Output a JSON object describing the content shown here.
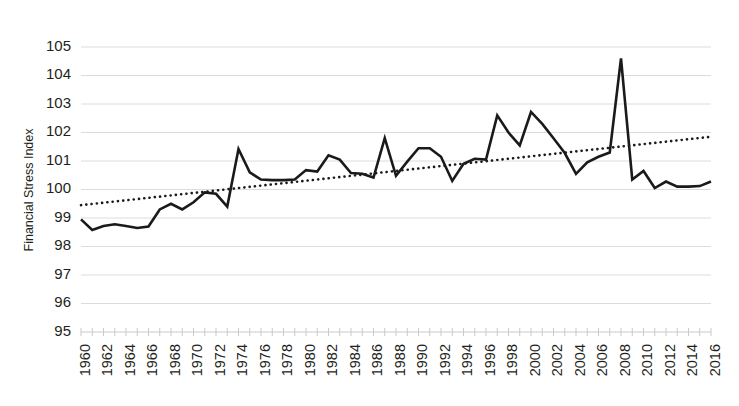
{
  "chart_data": {
    "type": "line",
    "title": "",
    "xlabel": "",
    "ylabel": "Financial Stress Index",
    "xlim": [
      1960,
      2016
    ],
    "ylim": [
      95,
      105
    ],
    "ytick_step": 1,
    "yticks": [
      95,
      96,
      97,
      98,
      99,
      100,
      101,
      102,
      103,
      104,
      105
    ],
    "xticks_minor_step": 1,
    "xtick_label_step": 2,
    "xtick_labels": [
      "1960",
      "1962",
      "1964",
      "1966",
      "1968",
      "1970",
      "1972",
      "1974",
      "1976",
      "1978",
      "1980",
      "1982",
      "1984",
      "1986",
      "1988",
      "1990",
      "1992",
      "1994",
      "1996",
      "1998",
      "2000",
      "2002",
      "2004",
      "2006",
      "2008",
      "2010",
      "2012",
      "2014",
      "2016"
    ],
    "grid": "horizontal",
    "legend": "none",
    "series": [
      {
        "name": "Financial Stress Index",
        "style": "solid",
        "color": "#1a1a1a",
        "width": 2.6,
        "x": [
          1960,
          1961,
          1962,
          1963,
          1964,
          1965,
          1966,
          1967,
          1968,
          1969,
          1970,
          1971,
          1972,
          1973,
          1974,
          1975,
          1976,
          1977,
          1978,
          1979,
          1980,
          1981,
          1982,
          1983,
          1984,
          1985,
          1986,
          1987,
          1988,
          1989,
          1990,
          1991,
          1992,
          1993,
          1994,
          1995,
          1996,
          1997,
          1998,
          1999,
          2000,
          2001,
          2002,
          2003,
          2004,
          2005,
          2006,
          2007,
          2008,
          2009,
          2010,
          2011,
          2012,
          2013,
          2014,
          2015,
          2016
        ],
        "values": [
          98.95,
          98.58,
          98.72,
          98.78,
          98.72,
          98.65,
          98.7,
          99.3,
          99.5,
          99.3,
          99.55,
          99.9,
          99.85,
          99.4,
          101.42,
          100.6,
          100.35,
          100.33,
          100.33,
          100.35,
          100.68,
          100.63,
          101.2,
          101.05,
          100.58,
          100.55,
          100.42,
          101.8,
          100.48,
          100.98,
          101.45,
          101.45,
          101.15,
          100.3,
          100.9,
          101.08,
          101.05,
          102.6,
          102.0,
          101.55,
          102.72,
          102.3,
          101.8,
          101.28,
          100.55,
          100.95,
          101.15,
          101.3,
          104.6,
          100.35,
          100.65,
          100.05,
          100.28,
          100.1,
          100.1,
          100.12,
          100.28
        ]
      },
      {
        "name": "Linear trend",
        "style": "dotted",
        "color": "#1a1a1a",
        "width": 2.6,
        "x": [
          1960,
          2016
        ],
        "values": [
          99.45,
          101.85
        ]
      }
    ]
  }
}
